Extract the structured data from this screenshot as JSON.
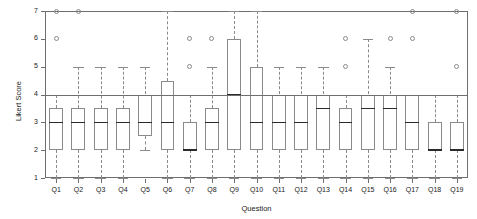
{
  "chart": {
    "type": "boxplot",
    "title": "",
    "xlabel": "Question",
    "ylabel": "Likert Score",
    "ylim": [
      1,
      7
    ],
    "yticks": [
      1,
      2,
      3,
      4,
      5,
      6,
      7
    ],
    "ytick_labels": [
      "1",
      "2",
      "3",
      "4",
      "5",
      "6",
      "7"
    ],
    "grid": false,
    "reference_line": 4,
    "legend": "none",
    "categories": [
      "Q1",
      "Q2",
      "Q3",
      "Q4",
      "Q5",
      "Q6",
      "Q7",
      "Q8",
      "Q9",
      "Q10",
      "Q11",
      "Q12",
      "Q13",
      "Q14",
      "Q15",
      "Q16",
      "Q17",
      "Q18",
      "Q19"
    ]
  },
  "chart_data": {
    "type": "boxplot",
    "title": "",
    "xlabel": "Question",
    "ylabel": "Likert Score",
    "ylim": [
      1,
      7
    ],
    "yticks": [
      1,
      2,
      3,
      4,
      5,
      6,
      7
    ],
    "grid": false,
    "legend": "none",
    "reference_line_y": 4,
    "categories": [
      "Q1",
      "Q2",
      "Q3",
      "Q4",
      "Q5",
      "Q6",
      "Q7",
      "Q8",
      "Q9",
      "Q10",
      "Q11",
      "Q12",
      "Q13",
      "Q14",
      "Q15",
      "Q16",
      "Q17",
      "Q18",
      "Q19"
    ],
    "boxes": [
      {
        "label": "Q1",
        "whisker_low": 1,
        "q1": 2,
        "median": 3,
        "q3": 3.5,
        "whisker_high": 4,
        "outliers": [
          6,
          7
        ]
      },
      {
        "label": "Q2",
        "whisker_low": 1,
        "q1": 2,
        "median": 3,
        "q3": 3.5,
        "whisker_high": 5,
        "outliers": [
          7
        ]
      },
      {
        "label": "Q3",
        "whisker_low": 1,
        "q1": 2,
        "median": 3,
        "q3": 3.5,
        "whisker_high": 5,
        "outliers": []
      },
      {
        "label": "Q4",
        "whisker_low": 1,
        "q1": 2,
        "median": 3,
        "q3": 3.5,
        "whisker_high": 5,
        "outliers": []
      },
      {
        "label": "Q5",
        "whisker_low": 2,
        "q1": 2.5,
        "median": 3,
        "q3": 4,
        "whisker_high": 5,
        "outliers": []
      },
      {
        "label": "Q6",
        "whisker_low": 1,
        "q1": 2,
        "median": 3,
        "q3": 4.5,
        "whisker_high": 7,
        "outliers": []
      },
      {
        "label": "Q7",
        "whisker_low": 1,
        "q1": 2,
        "median": 2,
        "q3": 3,
        "whisker_high": 4,
        "outliers": [
          5,
          6
        ]
      },
      {
        "label": "Q8",
        "whisker_low": 1,
        "q1": 2,
        "median": 3,
        "q3": 3.5,
        "whisker_high": 5,
        "outliers": [
          6
        ]
      },
      {
        "label": "Q9",
        "whisker_low": 1,
        "q1": 2,
        "median": 4,
        "q3": 6,
        "whisker_high": 7,
        "outliers": []
      },
      {
        "label": "Q10",
        "whisker_low": 1,
        "q1": 2,
        "median": 3,
        "q3": 5,
        "whisker_high": 7,
        "outliers": []
      },
      {
        "label": "Q11",
        "whisker_low": 1,
        "q1": 2,
        "median": 3,
        "q3": 4,
        "whisker_high": 5,
        "outliers": []
      },
      {
        "label": "Q12",
        "whisker_low": 1,
        "q1": 2,
        "median": 3,
        "q3": 4,
        "whisker_high": 5,
        "outliers": []
      },
      {
        "label": "Q13",
        "whisker_low": 1,
        "q1": 2,
        "median": 3.5,
        "q3": 4,
        "whisker_high": 5,
        "outliers": []
      },
      {
        "label": "Q14",
        "whisker_low": 1,
        "q1": 2,
        "median": 3,
        "q3": 3.5,
        "whisker_high": 4,
        "outliers": [
          5,
          6
        ]
      },
      {
        "label": "Q15",
        "whisker_low": 1,
        "q1": 2,
        "median": 3.5,
        "q3": 4,
        "whisker_high": 6,
        "outliers": []
      },
      {
        "label": "Q16",
        "whisker_low": 1,
        "q1": 2,
        "median": 3.5,
        "q3": 4,
        "whisker_high": 5,
        "outliers": [
          6
        ]
      },
      {
        "label": "Q17",
        "whisker_low": 1,
        "q1": 2,
        "median": 3,
        "q3": 4,
        "whisker_high": 4,
        "outliers": [
          6,
          7
        ]
      },
      {
        "label": "Q18",
        "whisker_low": 1,
        "q1": 2,
        "median": 2,
        "q3": 3,
        "whisker_high": 4,
        "outliers": []
      },
      {
        "label": "Q19",
        "whisker_low": 1,
        "q1": 2,
        "median": 2,
        "q3": 3,
        "whisker_high": 4,
        "outliers": [
          5,
          7
        ]
      }
    ]
  },
  "style": {
    "frame_color": "#6e6e6e",
    "box_color": "#8a8a8a",
    "median_color": "#2a2a2a",
    "text_color": "#1a1a1a",
    "background": "#ffffff"
  }
}
